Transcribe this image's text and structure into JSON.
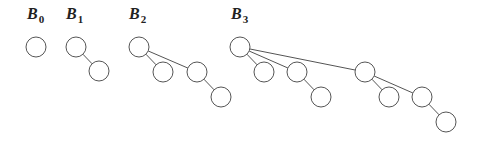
{
  "trees": [
    {
      "label": "B",
      "sub": "0",
      "lx": 27,
      "ly": 19,
      "nodes": [
        [
          36,
          47
        ]
      ],
      "edges": []
    },
    {
      "label": "B",
      "sub": "1",
      "lx": 66,
      "ly": 19,
      "nodes": [
        [
          76,
          47
        ],
        [
          99,
          71
        ]
      ],
      "edges": [
        [
          0,
          1
        ]
      ]
    },
    {
      "label": "B",
      "sub": "2",
      "lx": 129,
      "ly": 19,
      "nodes": [
        [
          139,
          47
        ],
        [
          163,
          72
        ],
        [
          197,
          72
        ],
        [
          221,
          97
        ]
      ],
      "edges": [
        [
          0,
          1
        ],
        [
          0,
          2
        ],
        [
          2,
          3
        ]
      ]
    },
    {
      "label": "B",
      "sub": "3",
      "lx": 231,
      "ly": 19,
      "nodes": [
        [
          240,
          47
        ],
        [
          264,
          72
        ],
        [
          297,
          72
        ],
        [
          321,
          97
        ],
        [
          365,
          72
        ],
        [
          389,
          97
        ],
        [
          422,
          97
        ],
        [
          446,
          122
        ]
      ],
      "edges": [
        [
          0,
          1
        ],
        [
          0,
          2
        ],
        [
          2,
          3
        ],
        [
          0,
          4
        ],
        [
          4,
          5
        ],
        [
          4,
          6
        ],
        [
          6,
          7
        ]
      ]
    }
  ],
  "node_radius": 10
}
